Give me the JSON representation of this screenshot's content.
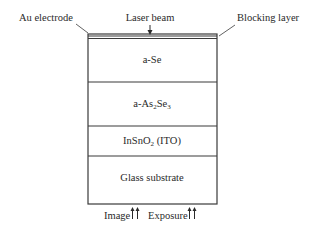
{
  "diagram": {
    "type": "layer-stack",
    "labels": {
      "au_electrode": "Au electrode",
      "laser_beam": "Laser beam",
      "blocking_layer": "Blocking layer",
      "image": "Image",
      "exposure": "Exposure"
    },
    "layers": [
      {
        "name": "a-Se",
        "main": "a-Se",
        "sub": "",
        "tail": ""
      },
      {
        "name": "a-As2Se3",
        "main": "a-As",
        "sub": "2",
        "mid": "Se",
        "sub2": "3"
      },
      {
        "name": "InSnO2 (ITO)",
        "main": "InSnO",
        "sub": "2",
        "tail": " (ITO)"
      },
      {
        "name": "Glass substrate",
        "main": "Glass substrate"
      }
    ],
    "colors": {
      "line": "#3a3a3a",
      "text": "#2a2a2a",
      "background": "#ffffff"
    }
  }
}
